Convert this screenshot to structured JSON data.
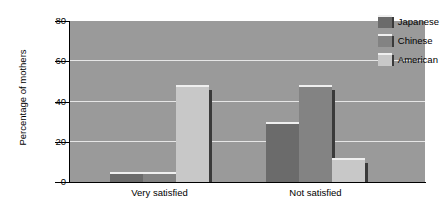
{
  "chart_data": {
    "type": "bar",
    "title": "",
    "xlabel": "",
    "ylabel": "Percentage of mothers",
    "ylim": [
      0,
      80
    ],
    "yticks": [
      0,
      20,
      40,
      60,
      80
    ],
    "grid": "horizontal",
    "legend_position": "top-right",
    "categories": [
      "Very satisfied",
      "Not satisfied"
    ],
    "series": [
      {
        "name": "Japanese",
        "color": "#6b6b6b",
        "values": [
          4,
          29
        ]
      },
      {
        "name": "Chinese",
        "color": "#838383",
        "values": [
          4,
          47
        ]
      },
      {
        "name": "American",
        "color": "#c8c8c8",
        "values": [
          47,
          11
        ]
      }
    ]
  },
  "style": {
    "plot_background": "#9a9a9a",
    "gridline_color": "#e6e6e6",
    "axis_color": "#000000",
    "page_background": "#ffffff",
    "bar_shadow": "#3a3a3a",
    "bar_highlight": "#efefef"
  }
}
